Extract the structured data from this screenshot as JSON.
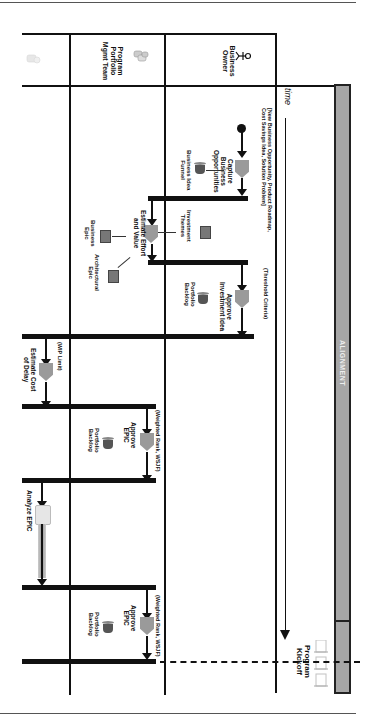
{
  "diagram": {
    "orientation": "rotated-90-clockwise",
    "swimlanes": [
      {
        "name": "Business Owner",
        "label": "Business\nOwner",
        "icon": "actor-icon"
      },
      {
        "name": "Program Portfolio Mgmt Team",
        "label": "Program\nPortfolio\nMgmt Team",
        "icon": "team-icon"
      },
      {
        "name": "Unlabeled",
        "label": "",
        "icon": "faded-team-icon"
      }
    ],
    "time_label": "time",
    "phase_label": "ALIGNMENT",
    "milestone_label": "Program\nKickoff",
    "trigger_note": "[New Business Opportunity, Product Roadmap,\nCost Savings Idea, Solution Problem]",
    "threshold_note": "(Threshold Criteria)",
    "wip_note": "(WIP Limit)",
    "weighted_note_1": "(Weighted Rank, WSJF)",
    "weighted_note_2": "(Weighted Rank, WSJF)",
    "tasks": [
      {
        "id": "capture",
        "label": "Capture\nBusiness\nOpportunities",
        "lane": "Business Owner"
      },
      {
        "id": "estimate",
        "label": "Estimate Effort\nand Value",
        "lane": "Program Portfolio Mgmt Team"
      },
      {
        "id": "approve-idea",
        "label": "Approve\nInvestment Idea",
        "lane": "Business Owner"
      },
      {
        "id": "estimate-cod",
        "label": "Estimate Cost\nof Delay",
        "lane": "Unlabeled"
      },
      {
        "id": "approve-epic-1",
        "label": "Approve\nEPIC",
        "lane": "Program Portfolio Mgmt Team"
      },
      {
        "id": "analyze-epic",
        "label": "Analyze EPIC",
        "lane": "Unlabeled"
      },
      {
        "id": "approve-epic-2",
        "label": "Approve\nEPIC",
        "lane": "Program Portfolio Mgmt Team"
      }
    ],
    "artifacts": [
      {
        "label": "Business Idea\nFunnel",
        "icon": "bucket-icon"
      },
      {
        "label": "Investment\nThemes",
        "icon": "document-icon"
      },
      {
        "label": "Business\nEpic",
        "icon": "document-icon"
      },
      {
        "label": "Architectural\nEpic",
        "icon": "document-icon"
      },
      {
        "label": "Portfolio\nBacklog",
        "icon": "bucket-icon"
      },
      {
        "label": "Portfolio\nBacklog",
        "icon": "bucket-icon"
      },
      {
        "label": "Portfolio\nBacklog",
        "icon": "bucket-icon"
      }
    ]
  }
}
